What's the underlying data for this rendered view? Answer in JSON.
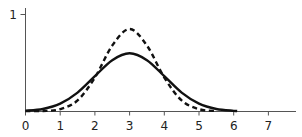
{
  "chart_data": {
    "type": "line",
    "title": "",
    "xlabel": "",
    "ylabel": "",
    "xlim": [
      0,
      7.8
    ],
    "ylim": [
      0,
      1
    ],
    "x_ticks": [
      0,
      1,
      2,
      3,
      4,
      5,
      6,
      7
    ],
    "x_tick_labels": [
      "0",
      "1",
      "2",
      "3",
      "4",
      "5",
      "6",
      "7"
    ],
    "y_ticks": [
      1
    ],
    "y_tick_labels": [
      "1"
    ],
    "grid": false,
    "legend": null,
    "series": [
      {
        "name": "solid curve",
        "style": "solid",
        "color": "#111111",
        "x": [
          0,
          0.5,
          1,
          1.5,
          2,
          2.5,
          3,
          3.5,
          4,
          4.5,
          5,
          5.5,
          6,
          6.1
        ],
        "values": [
          0.007,
          0.026,
          0.081,
          0.195,
          0.364,
          0.529,
          0.6,
          0.529,
          0.364,
          0.195,
          0.081,
          0.026,
          0.007,
          0.005
        ]
      },
      {
        "name": "dashed curve",
        "style": "dashed",
        "color": "#111111",
        "x": [
          0,
          0.5,
          1,
          1.5,
          2,
          2.5,
          3,
          3.5,
          4,
          4.5,
          5,
          5.5
        ],
        "values": [
          0.0,
          0.004,
          0.024,
          0.114,
          0.35,
          0.68,
          0.85,
          0.68,
          0.35,
          0.114,
          0.024,
          0.004
        ]
      }
    ]
  }
}
